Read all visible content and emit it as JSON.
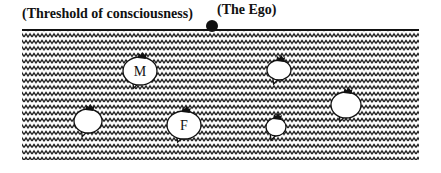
{
  "diagram": {
    "threshold_label": "(Threshold of consciousness)",
    "ego_label": "(The Ego)",
    "colors": {
      "ink": "#111111",
      "background": "#ffffff",
      "bubble_fill": "#ffffff"
    },
    "unconscious_region": {
      "x": 22,
      "y": 31,
      "width": 397,
      "height": 129,
      "pattern": "zigzag-waves"
    },
    "ego_dot": {
      "cx": 212,
      "cy": 26,
      "r": 6
    },
    "bubbles": [
      {
        "id": "m",
        "label": "M",
        "cx": 140,
        "cy": 71,
        "rx": 17,
        "ry": 14
      },
      {
        "id": "f",
        "label": "F",
        "cx": 184,
        "cy": 125,
        "rx": 17,
        "ry": 14
      },
      {
        "id": "left",
        "label": "",
        "cx": 88,
        "cy": 121,
        "rx": 14,
        "ry": 12
      },
      {
        "id": "upper-right",
        "label": "",
        "cx": 279,
        "cy": 70,
        "rx": 12,
        "ry": 10
      },
      {
        "id": "lower-right",
        "label": "",
        "cx": 276,
        "cy": 127,
        "rx": 10,
        "ry": 9
      },
      {
        "id": "far-right",
        "label": "",
        "cx": 346,
        "cy": 105,
        "rx": 15,
        "ry": 13
      }
    ]
  }
}
